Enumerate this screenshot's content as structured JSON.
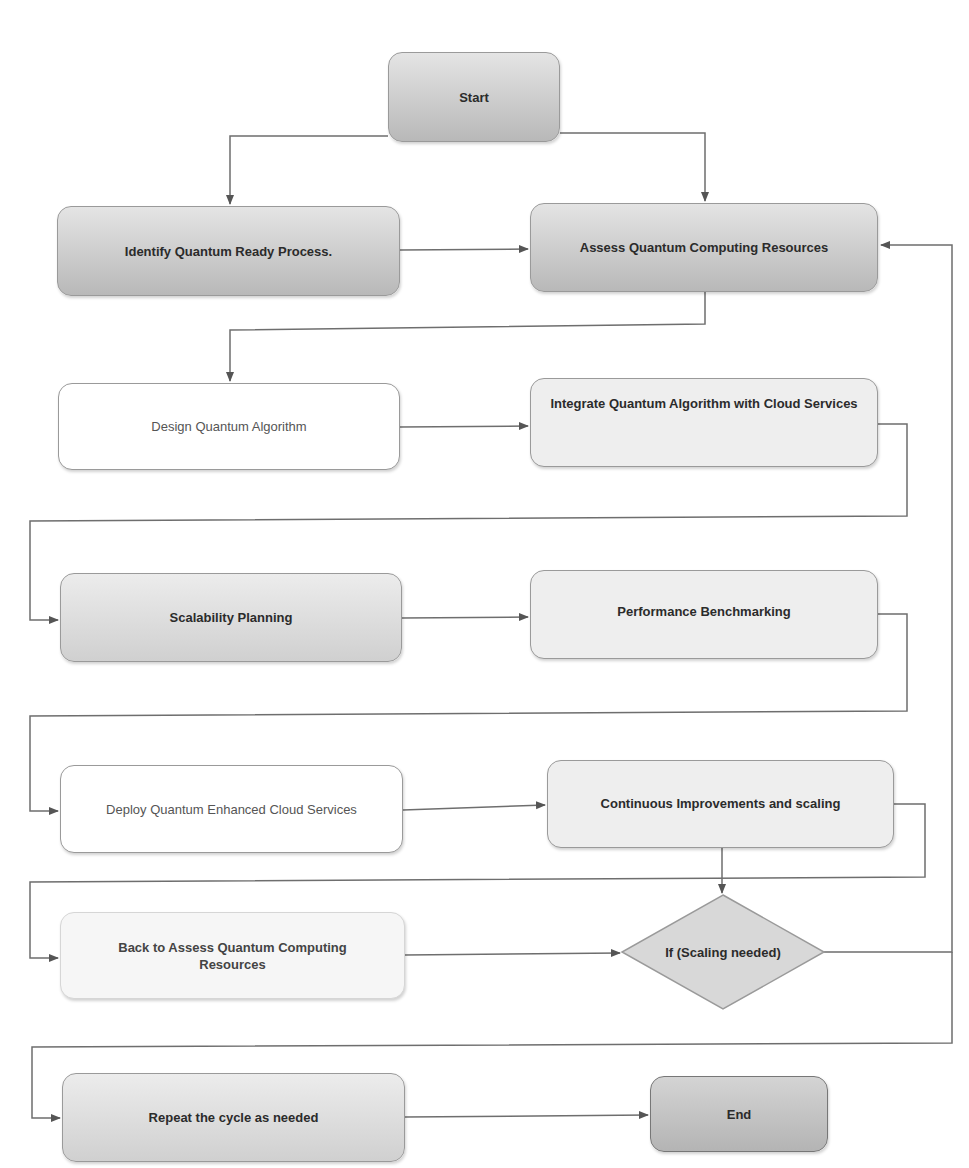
{
  "diagram": {
    "type": "flowchart",
    "nodes": {
      "start": {
        "label": "Start"
      },
      "identify": {
        "label": "Identify Quantum Ready Process."
      },
      "assess": {
        "label": "Assess Quantum Computing Resources"
      },
      "design": {
        "label": "Design Quantum Algorithm"
      },
      "integrate": {
        "label": "Integrate Quantum Algorithm with Cloud Services"
      },
      "scalability": {
        "label": "Scalability Planning"
      },
      "benchmark": {
        "label": "Performance Benchmarking"
      },
      "deploy": {
        "label": "Deploy Quantum Enhanced Cloud Services"
      },
      "improve": {
        "label": "Continuous Improvements and scaling"
      },
      "back": {
        "label": "Back to Assess Quantum Computing Resources"
      },
      "decision": {
        "label": "If (Scaling needed)"
      },
      "repeat": {
        "label": "Repeat the cycle as needed"
      },
      "end": {
        "label": "End"
      }
    },
    "edges": [
      {
        "from": "Start",
        "to": "Identify Quantum Ready Process."
      },
      {
        "from": "Start",
        "to": "Assess Quantum Computing Resources"
      },
      {
        "from": "Identify Quantum Ready Process.",
        "to": "Assess Quantum Computing Resources"
      },
      {
        "from": "Assess Quantum Computing Resources",
        "to": "Design Quantum Algorithm"
      },
      {
        "from": "Design Quantum Algorithm",
        "to": "Integrate Quantum Algorithm with Cloud Services"
      },
      {
        "from": "Integrate Quantum Algorithm with Cloud Services",
        "to": "Scalability Planning"
      },
      {
        "from": "Scalability Planning",
        "to": "Performance Benchmarking"
      },
      {
        "from": "Performance Benchmarking",
        "to": "Deploy Quantum Enhanced Cloud Services"
      },
      {
        "from": "Deploy Quantum Enhanced Cloud Services",
        "to": "Continuous Improvements and scaling"
      },
      {
        "from": "Continuous Improvements and scaling",
        "to": "If (Scaling needed)"
      },
      {
        "from": "Continuous Improvements and scaling",
        "to": "Back to Assess Quantum Computing Resources"
      },
      {
        "from": "Back to Assess Quantum Computing Resources",
        "to": "If (Scaling needed)"
      },
      {
        "from": "If (Scaling needed)",
        "to": "Assess Quantum Computing Resources"
      },
      {
        "from": "If (Scaling needed)",
        "to": "Repeat the cycle as needed"
      },
      {
        "from": "Repeat the cycle as needed",
        "to": "End"
      }
    ],
    "colors": {
      "line": "#6e6e6e",
      "border": "#9a9a9a",
      "text": "#2b2b2b"
    }
  }
}
